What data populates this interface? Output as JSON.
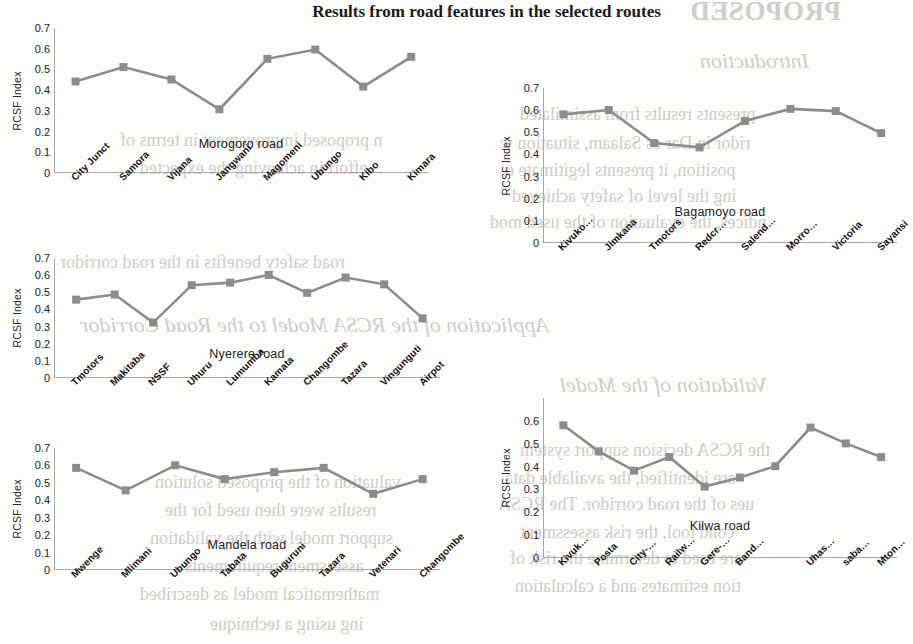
{
  "page": {
    "title": "Results from road features in the selected routes"
  },
  "background_text": {
    "items": [
      {
        "text": "PROPOSED",
        "style": "big",
        "x": 690,
        "y": -4
      },
      {
        "text": "Introduction",
        "style": "head",
        "x": 700,
        "y": 48
      },
      {
        "text": "presents results from assimilated",
        "style": "body",
        "x": 520,
        "y": 104
      },
      {
        "text": "ridor in Dar es Salaam, situation w",
        "style": "body",
        "x": 500,
        "y": 133
      },
      {
        "text": "position, it presents legitimate o",
        "style": "body",
        "x": 505,
        "y": 160
      },
      {
        "text": "ing the level of safety achieved",
        "style": "body",
        "x": 512,
        "y": 186
      },
      {
        "text": "ndices, the evaluation of the used mod",
        "style": "body",
        "x": 490,
        "y": 212
      },
      {
        "text": "n proposed improvement in terms of",
        "style": "body",
        "x": 120,
        "y": 130
      },
      {
        "text": "effort in achieving the expected",
        "style": "body",
        "x": 140,
        "y": 158
      },
      {
        "text": "road safety benefits in the road corridor",
        "style": "body",
        "x": 60,
        "y": 252
      },
      {
        "text": "Application of the RCSA Model to the Road Corridor",
        "style": "head",
        "x": 80,
        "y": 312
      },
      {
        "text": "Validation of the Model",
        "style": "head",
        "x": 560,
        "y": 372
      },
      {
        "text": "the RCSA decision support system",
        "style": "body",
        "x": 520,
        "y": 440
      },
      {
        "text": "are identified, the available data",
        "style": "body",
        "x": 505,
        "y": 468
      },
      {
        "text": "ues of the road corridor. The RCSA",
        "style": "body",
        "x": 498,
        "y": 494
      },
      {
        "text": "cond tool, the risk assessment",
        "style": "body",
        "x": 520,
        "y": 522
      },
      {
        "text": "are used to determine the risk of",
        "style": "body",
        "x": 510,
        "y": 548
      },
      {
        "text": "tion estimates and a calculation",
        "style": "body",
        "x": 515,
        "y": 576
      },
      {
        "text": "valuation of the proposed solution",
        "style": "body",
        "x": 155,
        "y": 472
      },
      {
        "text": "results were then used for the",
        "style": "body",
        "x": 165,
        "y": 500
      },
      {
        "text": "support model with the validation",
        "style": "body",
        "x": 150,
        "y": 528
      },
      {
        "text": "assessment requirements",
        "style": "body",
        "x": 185,
        "y": 556
      },
      {
        "text": "mathematical model as described",
        "style": "body",
        "x": 140,
        "y": 584
      },
      {
        "text": "ing using a technique",
        "style": "body",
        "x": 210,
        "y": 614
      }
    ]
  },
  "chart_data": [
    {
      "id": "morogoro",
      "type": "line",
      "title": "Morogoro road",
      "ylabel": "RCSF Index",
      "xlabel": "",
      "ylim": [
        0,
        0.7
      ],
      "yticks": [
        0,
        0.1,
        0.2,
        0.3,
        0.4,
        0.5,
        0.6,
        0.7
      ],
      "ytick_labels": [
        "0",
        "0.1",
        "0.2",
        "0.3",
        "0.4",
        "0.5",
        "0.6",
        "0.7"
      ],
      "grid": false,
      "legend": "none",
      "categories": [
        "City Junct",
        "Samora",
        "Vijana",
        "Jangwani",
        "Magomeni",
        "Ubungo",
        "Kibo",
        "Kimara"
      ],
      "values": [
        0.44,
        0.51,
        0.45,
        0.305,
        0.55,
        0.595,
        0.415,
        0.56
      ]
    },
    {
      "id": "bagamoyo",
      "type": "line",
      "title": "Bagamoyo road",
      "ylabel": "RCSF Index",
      "xlabel": "",
      "ylim": [
        0,
        0.7
      ],
      "yticks": [
        0,
        0.1,
        0.2,
        0.3,
        0.4,
        0.5,
        0.6,
        0.7
      ],
      "ytick_labels": [
        "0",
        "0.1",
        "0.2",
        "0.3",
        "0.4",
        "0.5",
        "0.6",
        "0.7"
      ],
      "grid": false,
      "legend": "none",
      "categories": [
        "Kivuko…",
        "Jimkana",
        "Tmotors",
        "Redcr…",
        "Salend…",
        "Morro…",
        "Victoria",
        "Sayansi"
      ],
      "values": [
        0.58,
        0.6,
        0.45,
        0.43,
        0.55,
        0.605,
        0.595,
        0.495
      ]
    },
    {
      "id": "nyerere",
      "type": "line",
      "title": "Nyerere road",
      "ylabel": "RCSF Index",
      "xlabel": "",
      "ylim": [
        0,
        0.7
      ],
      "yticks": [
        0,
        0.1,
        0.2,
        0.3,
        0.4,
        0.5,
        0.6,
        0.7
      ],
      "ytick_labels": [
        "0",
        "0.1",
        "0.2",
        "0.3",
        "0.4",
        "0.5",
        "0.6",
        "0.7"
      ],
      "grid": false,
      "legend": "none",
      "categories": [
        "Tmotors",
        "Makitaba",
        "NSSF",
        "Uhuru",
        "Lumumba",
        "Kamata",
        "Changombe",
        "Tazara",
        "Vingunguti",
        "Airpot"
      ],
      "values": [
        0.455,
        0.485,
        0.32,
        0.54,
        0.555,
        0.6,
        0.495,
        0.585,
        0.545,
        0.345
      ]
    },
    {
      "id": "mandela",
      "type": "line",
      "title": "Mandela road",
      "ylabel": "RCSF Index",
      "xlabel": "",
      "ylim": [
        0,
        0.7
      ],
      "yticks": [
        0,
        0.1,
        0.2,
        0.3,
        0.4,
        0.5,
        0.6,
        0.7
      ],
      "ytick_labels": [
        "0",
        "0.1",
        "0.2",
        "0.3",
        "0.4",
        "0.5",
        "0.6",
        "0.7"
      ],
      "grid": false,
      "legend": "none",
      "categories": [
        "Mwenge",
        "Mlimani",
        "Ubungo",
        "Tabata",
        "Buguruni",
        "Tazara",
        "Vetenari",
        "Changombe"
      ],
      "values": [
        0.585,
        0.455,
        0.6,
        0.52,
        0.56,
        0.585,
        0.435,
        0.52
      ]
    },
    {
      "id": "kilwa",
      "type": "line",
      "title": "Kilwa road",
      "ylabel": "RCSF Index",
      "xlabel": "",
      "ylim": [
        0,
        0.7
      ],
      "yticks": [
        0,
        0.1,
        0.2,
        0.3,
        0.4,
        0.5,
        0.6
      ],
      "ytick_labels": [
        "0",
        "0.1",
        "0.2",
        "0.3",
        "0.4",
        "0.5",
        "0.6"
      ],
      "grid": false,
      "legend": "none",
      "categories": [
        "Kivuk…",
        "Posta",
        "City-…",
        "Railw…",
        "Gere-…",
        "Band…",
        "",
        "Uhas…",
        "saba…",
        "Mton…"
      ],
      "values": [
        0.58,
        0.465,
        0.38,
        0.44,
        0.31,
        0.35,
        0.4,
        0.57,
        0.5,
        0.44
      ]
    }
  ],
  "colors": {
    "series": "#8c8c8c",
    "axis": "#a8a8a8",
    "text": "#1c1c1c",
    "background": "#fdfdfb"
  }
}
